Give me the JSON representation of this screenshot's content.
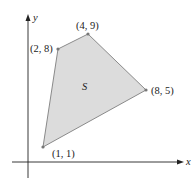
{
  "figure": {
    "region_label": "S",
    "axes": {
      "x_label": "x",
      "y_label": "y"
    },
    "vertices": [
      {
        "label": "(1, 1)",
        "x": 1,
        "y": 1
      },
      {
        "label": "(8, 5)",
        "x": 8,
        "y": 5
      },
      {
        "label": "(4, 9)",
        "x": 4,
        "y": 9
      },
      {
        "label": "(2, 8)",
        "x": 2,
        "y": 8
      }
    ],
    "colors": {
      "fill": "#dcdcdc",
      "edge": "#8a8a8a",
      "axis": "#222222",
      "point": "#777777"
    }
  }
}
